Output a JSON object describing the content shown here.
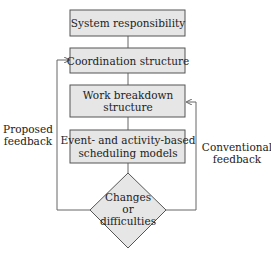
{
  "diagram": {
    "boxes": [
      {
        "id": "system-responsibility",
        "lines": [
          "System responsibility"
        ]
      },
      {
        "id": "coordination-structure",
        "lines": [
          "Coordination structure"
        ]
      },
      {
        "id": "work-breakdown-structure",
        "lines": [
          "Work breakdown",
          "structure"
        ]
      },
      {
        "id": "scheduling-models",
        "lines": [
          "Event- and activity-based",
          "scheduling models"
        ]
      }
    ],
    "decision": {
      "lines": [
        "Changes",
        "or",
        "difficulties"
      ]
    },
    "feedback": {
      "left": {
        "lines": [
          "Proposed",
          "feedback"
        ],
        "target": "coordination-structure"
      },
      "right": {
        "lines": [
          "Conventional",
          "feedback"
        ],
        "target": "work-breakdown-structure"
      }
    },
    "colors": {
      "box_fill": "#e6e6e6",
      "stroke": "#555555",
      "text": "#222222"
    }
  }
}
